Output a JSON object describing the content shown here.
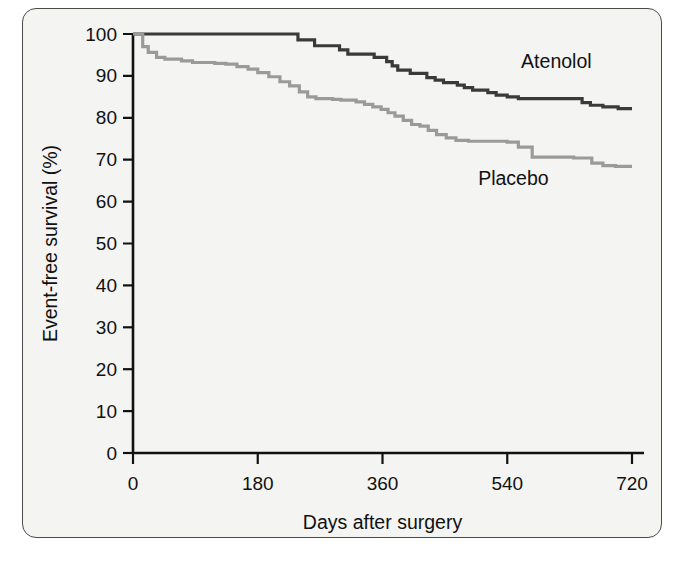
{
  "figure": {
    "background_color": "#f4f4f2",
    "border_color": "#4a4a4a",
    "caption": ""
  },
  "chart_data": {
    "type": "line",
    "subtype": "kaplan-meier-step",
    "title": "",
    "xlabel": "Days after surgery",
    "ylabel": "Event-free survival (%)",
    "xlim": [
      0,
      720
    ],
    "ylim": [
      0,
      100
    ],
    "xticks": [
      0,
      180,
      360,
      540,
      720
    ],
    "xtick_labels": [
      "0",
      "180",
      "360",
      "540",
      "720"
    ],
    "yticks": [
      0,
      10,
      20,
      30,
      40,
      50,
      60,
      70,
      80,
      90,
      100
    ],
    "ytick_labels": [
      "0",
      "10",
      "20",
      "30",
      "40",
      "50",
      "60",
      "70",
      "80",
      "90",
      "100"
    ],
    "grid": false,
    "legend_position": "inline-annotations",
    "series": [
      {
        "name": "Atenolol",
        "color": "#3a3a3a",
        "label_x": 560,
        "label_y": 92,
        "x": [
          0,
          8,
          230,
          238,
          250,
          262,
          272,
          285,
          298,
          310,
          322,
          335,
          348,
          358,
          366,
          374,
          382,
          392,
          400,
          412,
          424,
          436,
          448,
          458,
          468,
          478,
          490,
          500,
          512,
          524,
          540,
          556,
          572,
          600,
          630,
          648,
          660,
          678,
          700,
          720
        ],
        "y": [
          100,
          100,
          100,
          98.6,
          98.6,
          97.2,
          97.2,
          97.2,
          96.2,
          95.2,
          95.2,
          95.2,
          94.4,
          94.4,
          93.4,
          92.4,
          91.4,
          91.4,
          90.6,
          90.6,
          89.6,
          89.0,
          88.4,
          88.4,
          87.8,
          87.2,
          86.6,
          86.6,
          86.0,
          85.4,
          85.0,
          84.6,
          84.6,
          84.6,
          84.6,
          83.6,
          83.0,
          82.6,
          82.2,
          82.2
        ]
      },
      {
        "name": "Placebo",
        "color": "#9a9a9a",
        "label_x": 498,
        "label_y": 64,
        "x": [
          0,
          6,
          14,
          22,
          34,
          46,
          58,
          70,
          86,
          100,
          118,
          134,
          150,
          166,
          180,
          196,
          212,
          226,
          240,
          252,
          264,
          276,
          288,
          300,
          312,
          322,
          334,
          346,
          358,
          368,
          378,
          390,
          402,
          414,
          426,
          438,
          452,
          466,
          484,
          500,
          516,
          528,
          540,
          556,
          576,
          600,
          620,
          636,
          650,
          662,
          678,
          696,
          720
        ],
        "y": [
          100,
          100,
          97.0,
          95.6,
          94.4,
          94.0,
          94.0,
          93.6,
          93.2,
          93.2,
          93.0,
          92.8,
          92.2,
          91.6,
          90.8,
          89.8,
          88.6,
          87.6,
          86.2,
          85.0,
          84.6,
          84.6,
          84.4,
          84.2,
          84.2,
          83.8,
          83.2,
          82.6,
          82.0,
          81.2,
          80.4,
          79.4,
          78.4,
          78.0,
          77.0,
          76.0,
          75.2,
          74.6,
          74.4,
          74.4,
          74.4,
          74.4,
          74.2,
          73.0,
          70.6,
          70.6,
          70.6,
          70.4,
          70.4,
          69.2,
          68.6,
          68.4,
          68.4
        ]
      }
    ]
  }
}
